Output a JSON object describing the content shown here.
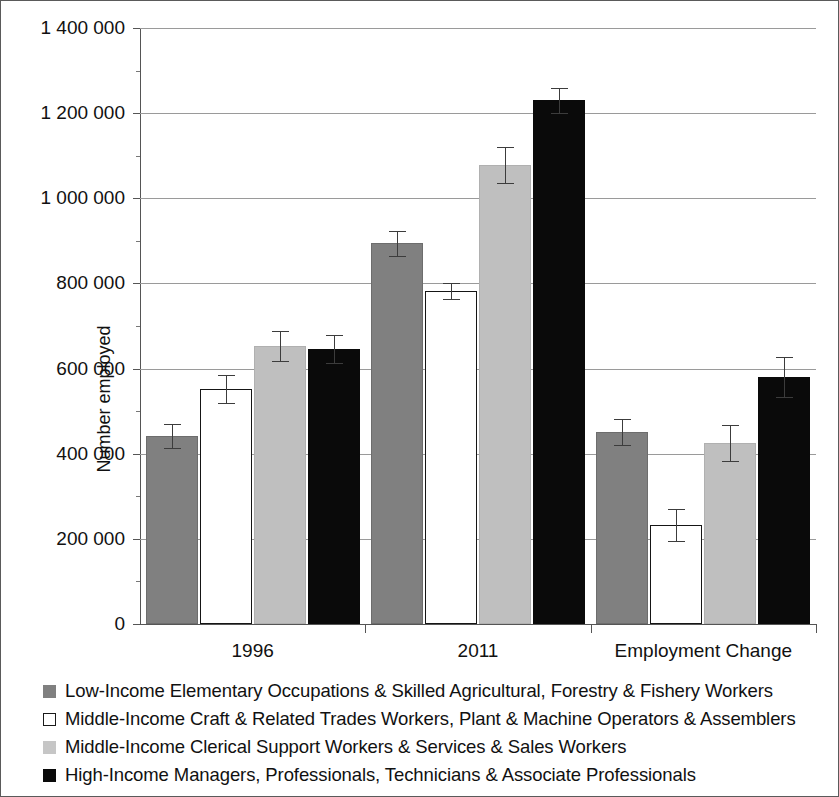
{
  "figure": {
    "background_color": "#ffffff",
    "border_color": "#5a5a5a"
  },
  "axes": {
    "y_title": "Number employed",
    "y_tick_labels": [
      "1 400 000",
      "1 200 000",
      "1 000 000",
      "800 000",
      "600 000",
      "400 000",
      "200 000",
      "0"
    ],
    "x_tick_labels": [
      "1996",
      "2011",
      "Employment Change"
    ]
  },
  "legend": {
    "items": [
      {
        "label": "Low-Income Elementary Occupations & Skilled Agricultural, Forestry & Fishery Workers",
        "color": "#808080",
        "swatch": "filled-square-dark-gray"
      },
      {
        "label": "Middle-Income Craft & Related Trades Workers, Plant & Machine Operators & Assemblers",
        "color": "#ffffff",
        "swatch": "open-square-white"
      },
      {
        "label": "Middle-Income Clerical Support Workers & Services & Sales Workers",
        "color": "#c6c6c6",
        "swatch": "filled-square-light-gray"
      },
      {
        "label": "High-Income Managers, Professionals, Technicians & Associate Professionals",
        "color": "#0a0a0a",
        "swatch": "filled-square-black"
      }
    ]
  },
  "chart_data": {
    "type": "bar",
    "title": "",
    "xlabel": "",
    "ylabel": "Number employed",
    "ylim": [
      0,
      1400000
    ],
    "ytick_interval": 200000,
    "yminor_tick_interval": 100000,
    "grid": "horizontal",
    "legend_position": "below-plot",
    "error_bars": "symmetric",
    "categories": [
      "1996",
      "2011",
      "Employment Change"
    ],
    "series": [
      {
        "name": "Low-Income Elementary Occupations & Skilled Agricultural, Forestry & Fishery Workers",
        "color": "#808080",
        "values": [
          441000,
          894000,
          451000
        ],
        "errors": [
          28000,
          30000,
          30000
        ]
      },
      {
        "name": "Middle-Income Craft & Related Trades Workers, Plant & Machine Operators & Assemblers",
        "color": "#ffffff",
        "values": [
          551000,
          783000,
          232000
        ],
        "errors": [
          33000,
          19000,
          37000
        ]
      },
      {
        "name": "Middle-Income Clerical Support Workers & Services & Sales Workers",
        "color": "#bfbfbf",
        "values": [
          653000,
          1079000,
          426000
        ],
        "errors": [
          35000,
          42000,
          42000
        ]
      },
      {
        "name": "High-Income Managers, Professionals, Technicians & Associate Professionals",
        "color": "#0a0a0a",
        "values": [
          645000,
          1230000,
          580000
        ],
        "errors": [
          33000,
          30000,
          47000
        ]
      }
    ]
  }
}
